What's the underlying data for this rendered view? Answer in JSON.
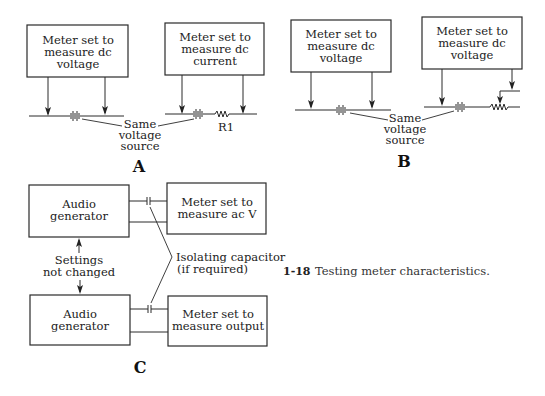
{
  "figure": {
    "number": "1-18",
    "caption": "Testing meter characteristics."
  },
  "panel_a": {
    "label": "A",
    "left_meter": [
      "Meter set to",
      "measure dc",
      "voltage"
    ],
    "right_meter": [
      "Meter set to",
      "measure dc",
      "current"
    ],
    "source_note": [
      "Same",
      "voltage",
      "source"
    ],
    "resistor_label": "R1"
  },
  "panel_b": {
    "label": "B",
    "left_meter": [
      "Meter set to",
      "measure dc",
      "voltage"
    ],
    "right_meter": [
      "Meter set to",
      "measure dc",
      "voltage"
    ],
    "source_note": [
      "Same",
      "voltage",
      "source"
    ]
  },
  "panel_c": {
    "label": "C",
    "top_generator": [
      "Audio",
      "generator"
    ],
    "top_meter": [
      "Meter set to",
      "measure ac V"
    ],
    "bottom_generator": [
      "Audio",
      "generator"
    ],
    "bottom_meter": [
      "Meter set to",
      "measure output"
    ],
    "settings_note": [
      "Settings",
      "not changed"
    ],
    "capacitor_note": [
      "Isolating capacitor",
      "(if required)"
    ]
  }
}
